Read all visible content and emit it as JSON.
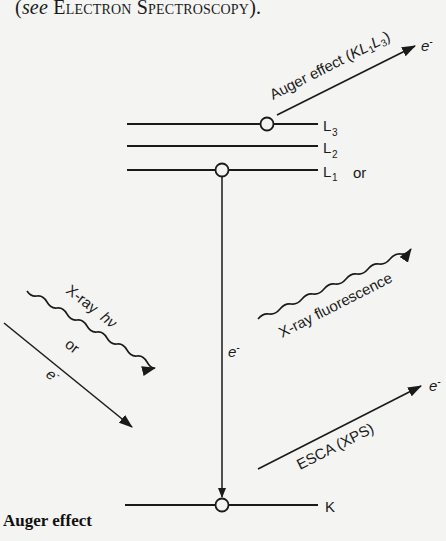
{
  "header": {
    "open_paren": "(",
    "see": "see",
    "reference": "Electron Spectroscopy",
    "close": ")."
  },
  "caption": {
    "title": "Auger effect"
  },
  "diagram": {
    "levels": [
      {
        "name": "L3",
        "main": "L",
        "sub": "3"
      },
      {
        "name": "L2",
        "main": "L",
        "sub": "2"
      },
      {
        "name": "L1",
        "main": "L",
        "sub": "1"
      },
      {
        "name": "K",
        "main": "K",
        "sub": ""
      }
    ],
    "or_right": "or",
    "processes": {
      "auger": {
        "label_prefix": "Auger effect (",
        "k": "KL",
        "sub1": "1",
        "l": "L",
        "sub3": "3",
        "close": ")",
        "particle": "e",
        "charge": "-"
      },
      "xray_fluorescence": {
        "label": "X-ray fluorescence"
      },
      "esca": {
        "label": "ESCA (XPS)",
        "particle": "e",
        "charge": "-"
      },
      "incoming_xray": {
        "label": "X-ray",
        "symbol": "hν"
      },
      "incoming_or": "or",
      "incoming_electron": {
        "particle": "e",
        "charge": "-"
      },
      "transition_electron": {
        "particle": "e",
        "charge": "-"
      }
    }
  },
  "colors": {
    "ink": "#1a1a1a",
    "paper": "#f4f4f2"
  }
}
